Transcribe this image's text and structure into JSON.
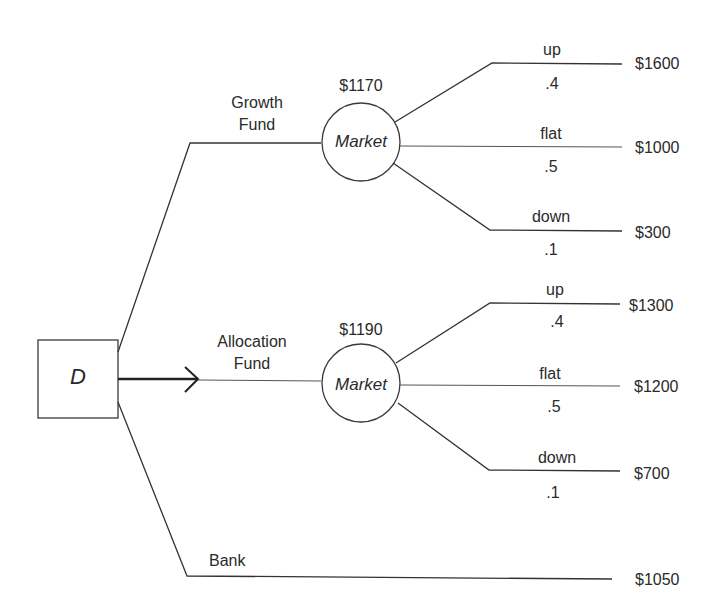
{
  "diagram": {
    "type": "decision-tree",
    "decision_node": {
      "label": "D"
    },
    "branches": [
      {
        "name": "Growth Fund",
        "label_line1": "Growth",
        "label_line2": "Fund",
        "chance_node": {
          "label": "Market",
          "expected_value": "$1170",
          "outcomes": [
            {
              "state": "up",
              "probability": ".4",
              "payoff": "$1600"
            },
            {
              "state": "flat",
              "probability": ".5",
              "payoff": "$1000"
            },
            {
              "state": "down",
              "probability": ".1",
              "payoff": "$300"
            }
          ]
        }
      },
      {
        "name": "Allocation Fund",
        "label_line1": "Allocation",
        "label_line2": "Fund",
        "selected": true,
        "chance_node": {
          "label": "Market",
          "expected_value": "$1190",
          "outcomes": [
            {
              "state": "up",
              "probability": ".4",
              "payoff": "$1300"
            },
            {
              "state": "flat",
              "probability": ".5",
              "payoff": "$1200"
            },
            {
              "state": "down",
              "probability": ".1",
              "payoff": "$700"
            }
          ]
        }
      },
      {
        "name": "Bank",
        "label_line1": "Bank",
        "payoff": "$1050"
      }
    ]
  },
  "colors": {
    "line": "#3a3a3a",
    "text": "#2a2a2a",
    "background": "#ffffff"
  }
}
